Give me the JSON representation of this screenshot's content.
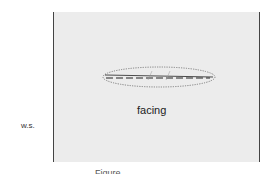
{
  "figure": {
    "labels": {
      "ws": "w.s.",
      "facing": "facing"
    },
    "caption": "Figure …",
    "colors": {
      "panel_bg": "#ececec",
      "lines": "#444444"
    }
  }
}
